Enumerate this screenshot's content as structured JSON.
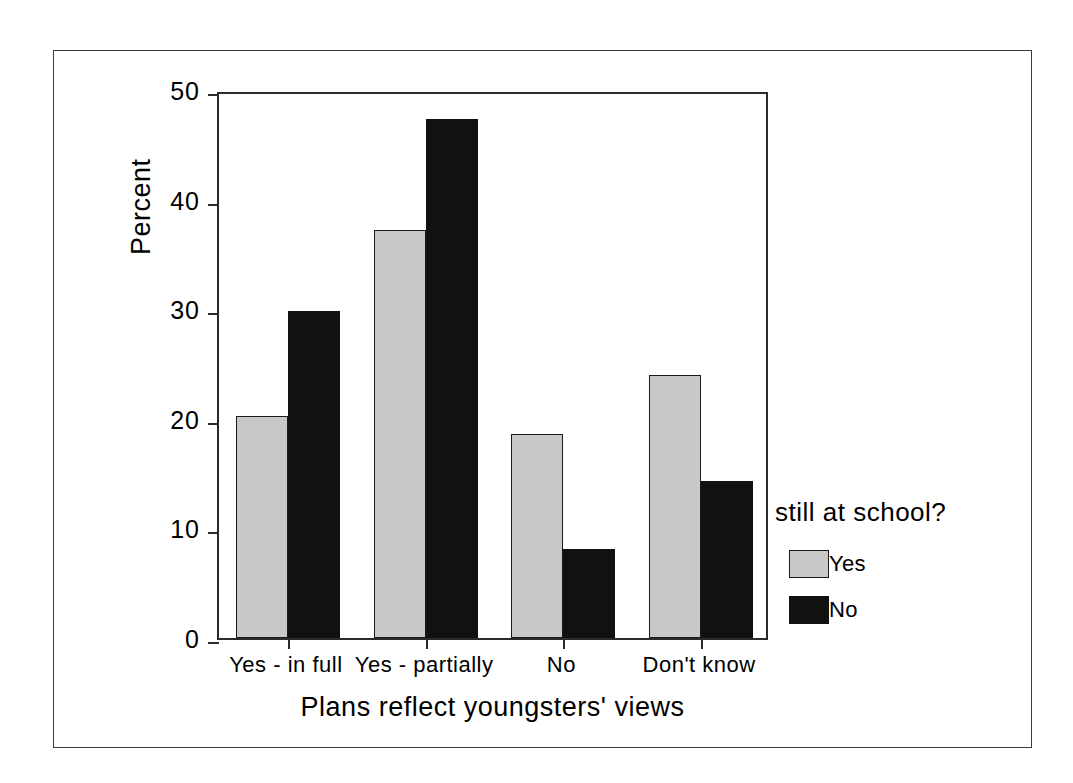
{
  "chart_data": {
    "type": "bar",
    "title": "",
    "xlabel": "Plans reflect youngsters' views",
    "ylabel": "Percent",
    "categories": [
      "Yes - in full",
      "Yes - partially",
      "No",
      "Don't know"
    ],
    "series": [
      {
        "name": "Yes",
        "color": "#c8c8c8",
        "values": [
          20.3,
          37.2,
          18.6,
          24.0
        ]
      },
      {
        "name": "No",
        "color": "#111111",
        "values": [
          29.8,
          47.4,
          8.1,
          14.3
        ]
      }
    ],
    "ylim": [
      0,
      50
    ],
    "yticks": [
      0,
      10,
      20,
      30,
      40,
      50
    ],
    "ytick_labels": [
      "0",
      "10",
      "20",
      "30",
      "40",
      "50"
    ],
    "grid": false,
    "legend": {
      "title": "still at school?",
      "position": "right",
      "entries": [
        "Yes",
        "No"
      ]
    }
  },
  "figure": {
    "frame_color": "#3b3b3b",
    "axis_color": "#2b2b2b",
    "background": "#ffffff"
  }
}
